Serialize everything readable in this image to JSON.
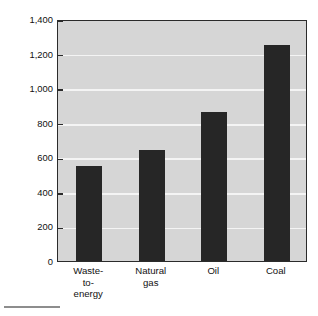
{
  "chart_data": {
    "type": "bar",
    "title": "",
    "subtitle": "",
    "xlabel": "",
    "ylabel": "Carbon dioxide (g per kilowatt-hour)",
    "categories": [
      "Waste-to-energy",
      "Natural gas",
      "Oil",
      "Coal"
    ],
    "category_lines": [
      [
        "Waste-",
        "to-",
        "energy"
      ],
      [
        "Natural",
        "gas"
      ],
      [
        "Oil"
      ],
      [
        "Coal"
      ]
    ],
    "values": [
      550,
      640,
      860,
      1250
    ],
    "ylim": [
      0,
      1400
    ],
    "yticks": [
      0,
      200,
      400,
      600,
      800,
      1000,
      1200,
      1400
    ],
    "ytick_labels": [
      "0",
      "200",
      "400",
      "600",
      "800",
      "1,000",
      "1,200",
      "1,400"
    ],
    "grid": true,
    "grid_axis": "y",
    "grid_color": "#f4f4f4",
    "legend": false,
    "legend_position": "none",
    "bar_color": "#262626",
    "plot_background": "#d6d6d6",
    "frame_color": "#2b2b2b",
    "figure_background": "#ffffff"
  }
}
